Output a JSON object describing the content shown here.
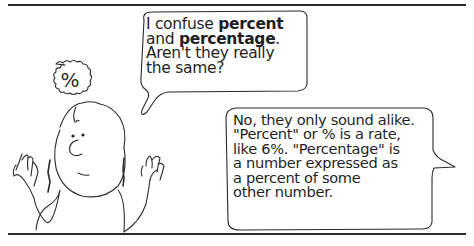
{
  "panel": {
    "question_bubble": {
      "line1_pre": "I confuse ",
      "line1_bold": "percent",
      "line2_pre": "and ",
      "line2_bold": "percentage",
      "line2_post": ".",
      "line3": "Aren't they really",
      "line4": "the same?"
    },
    "answer_bubble": {
      "lines": [
        "No, they only sound alike.",
        "\"Percent\" or % is a rate,",
        "like 6%. \"Percentage\" is",
        "a number expressed as",
        "a percent of some",
        "other number."
      ]
    },
    "thought_symbol": "%"
  }
}
